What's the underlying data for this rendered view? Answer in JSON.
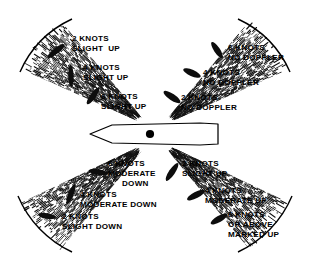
{
  "diagram": {
    "center_symbol": "aircraft-planform-icon",
    "colors": {
      "ink": "#000000",
      "background": "#ffffff",
      "hatch": "#1a1a1a",
      "blip": "#0d0d0d"
    },
    "quadrants": [
      {
        "id": "upper-left",
        "name": "upper-left-sector",
        "labels": [
          {
            "knots": "2 KNOTS",
            "meaning": "SLIGHT  UP"
          },
          {
            "knots": "4 KNOTS",
            "meaning": "SLIGHT UP"
          },
          {
            "knots": "6 KNOTS",
            "meaning": "SLIGHT UP"
          }
        ]
      },
      {
        "id": "upper-right",
        "name": "upper-right-sector",
        "labels": [
          {
            "knots": "6 KNOTS",
            "meaning": "NO DOPPLER"
          },
          {
            "knots": "4 KNOTS",
            "meaning": "NO DOPPLER"
          },
          {
            "knots": "2 KNOTS",
            "meaning": "NO DOPPLER"
          }
        ]
      },
      {
        "id": "lower-left",
        "name": "lower-left-sector",
        "labels": [
          {
            "knots": "6 KNOTS",
            "meaning": "MODERATE",
            "meaning2": "DOWN"
          },
          {
            "knots": "4 KNOTS",
            "meaning": "MODERATE DOWN"
          },
          {
            "knots": "2 KNOTS",
            "meaning": "SLIGHT DOWN"
          }
        ]
      },
      {
        "id": "lower-right",
        "name": "lower-right-sector",
        "labels": [
          {
            "knots": "2 KNOTS",
            "meaning": "SLIGHT UP"
          },
          {
            "knots": "4 KNOTS",
            "meaning": "MODERATE UP"
          },
          {
            "knots": "6 KNOTS",
            "meaning": "OR ABOVE",
            "meaning2": "MARKED UP"
          }
        ]
      }
    ],
    "text": {
      "ul_1_k": "2 KNOTS",
      "ul_1_m": "SLIGHT  UP",
      "ul_2_k": "4 KNOTS",
      "ul_2_m": "SLIGHT UP",
      "ul_3_k": "6 KNOTS",
      "ul_3_m": "SLIGHT UP",
      "ur_1_k": "6 KNOTS",
      "ur_1_m": "NO DOPPLER",
      "ur_2_k": "4 KNOTS",
      "ur_2_m": "NO DOPPLER",
      "ur_3_k": "2 KNOTS",
      "ur_3_m": "NO DOPPLER",
      "ll_1_k": "6 KNOTS",
      "ll_1_m": "MODERATE",
      "ll_1_m2": "DOWN",
      "ll_2_k": "4 KNOTS",
      "ll_2_m": "MODERATE DOWN",
      "ll_3_k": "2 KNOTS",
      "ll_3_m": "SLIGHT DOWN",
      "lr_1_k": "2 KNOTS",
      "lr_1_m": "SLIGHT UP",
      "lr_2_k": "4 KNOTS",
      "lr_2_m": "MODERATE UP",
      "lr_3_k": "6 KNOTS",
      "lr_3_m": "OR ABOVE",
      "lr_3_m2": "MARKED UP"
    }
  }
}
